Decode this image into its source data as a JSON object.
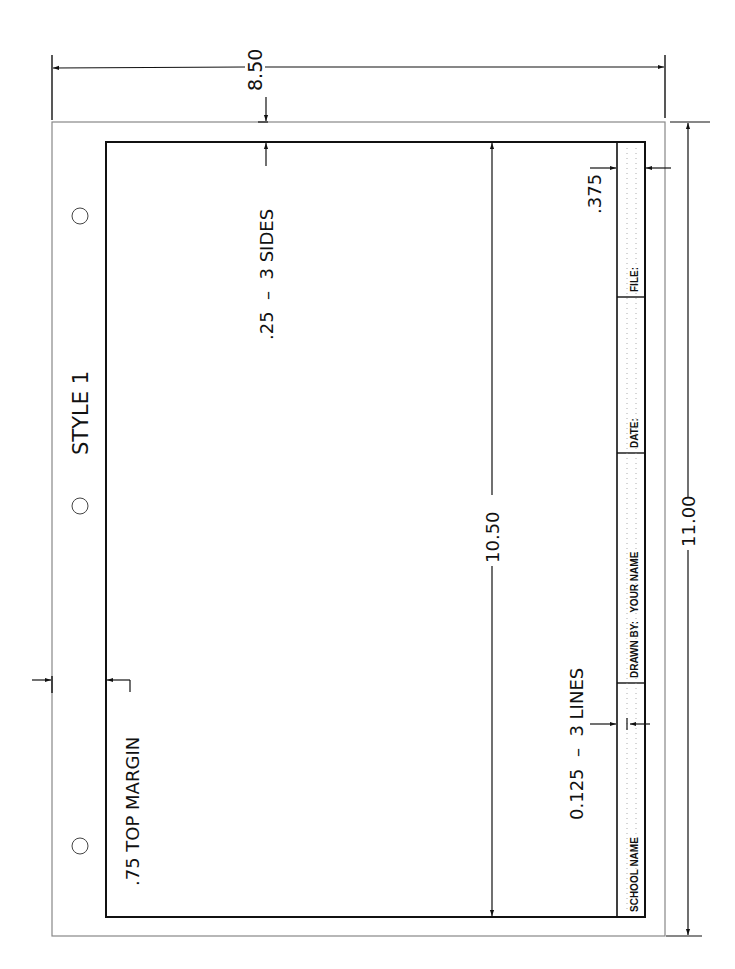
{
  "drawing": {
    "title": "STYLE 1",
    "colors": {
      "line": "#111111",
      "outer_border": "#888888",
      "dots": "#9a9a9a",
      "background": "#ffffff"
    }
  },
  "dimensions": {
    "sheet_width": "8.50",
    "sheet_height": "11.00",
    "border_height": "10.50",
    "side_margin": ".25  –  3 SIDES",
    "top_margin": ".75 TOP MARGIN",
    "title_block_height": ".375",
    "line_spacing": "0.125  –  3 LINES"
  },
  "title_block": {
    "fields": [
      {
        "label": "SCHOOL NAME"
      },
      {
        "label": "DRAWN BY:   YOUR NAME"
      },
      {
        "label": "DATE:"
      },
      {
        "label": "FILE:"
      }
    ]
  },
  "binder_holes": [
    {
      "name": "hole-top"
    },
    {
      "name": "hole-middle"
    },
    {
      "name": "hole-bottom"
    }
  ]
}
